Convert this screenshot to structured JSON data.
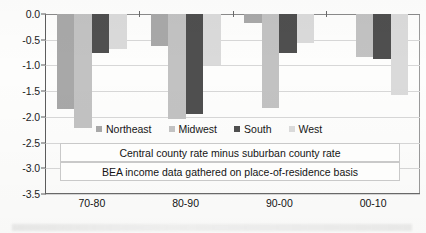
{
  "chart_data": {
    "type": "bar",
    "title": "",
    "subtitle": "",
    "xlabel": "",
    "ylabel": "",
    "categories": [
      "70-80",
      "80-90",
      "90-00",
      "00-10"
    ],
    "series": [
      {
        "name": "Northeast",
        "color": "#a8a8a8",
        "values": [
          -1.85,
          -0.63,
          -0.18,
          0.0
        ]
      },
      {
        "name": "Midwest",
        "color": "#c2c2c2",
        "values": [
          -2.22,
          -2.05,
          -1.82,
          -0.83
        ]
      },
      {
        "name": "South",
        "color": "#4f4f4f",
        "values": [
          -0.75,
          -1.95,
          -0.75,
          -0.88
        ]
      },
      {
        "name": "West",
        "color": "#dadada",
        "values": [
          -0.68,
          -1.0,
          -0.57,
          -1.58
        ]
      }
    ],
    "ylim": [
      -3.5,
      0.0
    ],
    "ytick_labels": [
      "0.0",
      "-0.5",
      "-1.0",
      "-1.5",
      "-2.0",
      "-2.5",
      "-3.0",
      "-3.5"
    ],
    "ytick_values": [
      0.0,
      -0.5,
      -1.0,
      -1.5,
      -2.0,
      -2.5,
      -3.0,
      -3.5
    ],
    "grid": true,
    "legend_position": "inside-bottom",
    "annotations": [
      "Central county rate minus suburban county rate",
      "BEA income data gathered on place-of-residence basis"
    ]
  },
  "legend": {
    "items": [
      {
        "label": "Northeast",
        "color": "#a8a8a8"
      },
      {
        "label": "Midwest",
        "color": "#c2c2c2"
      },
      {
        "label": "South",
        "color": "#4f4f4f"
      },
      {
        "label": "West",
        "color": "#dadada"
      }
    ]
  },
  "notes": {
    "line1": "Central county rate minus suburban county rate",
    "line2": "BEA income data gathered on place-of-residence basis"
  }
}
